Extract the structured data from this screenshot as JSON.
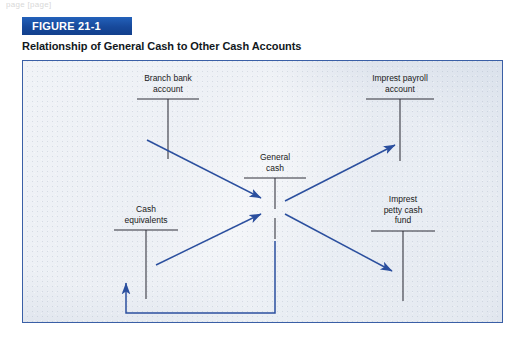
{
  "page": {
    "top_fragment": "page [page]"
  },
  "figure": {
    "banner_label": "FIGURE 21-1",
    "caption": "Relationship of General Cash to Other Cash Accounts",
    "banner_color": "#17499b",
    "frame_border_color": "#3a5fa6",
    "panel_background": "#d8dfe9",
    "arrow_color": "#2b4f9e",
    "taccount_color": "#2f2f38"
  },
  "diagram": {
    "type": "flow",
    "accounts": [
      {
        "id": "branch-bank-account",
        "lines": [
          "Branch bank",
          "account"
        ],
        "label_x": 145,
        "label_y": 16,
        "t_center_x": 145,
        "t_top_y": 38,
        "t_half_width": 31,
        "t_stem_bottom_y": 98
      },
      {
        "id": "imprest-payroll-account",
        "lines": [
          "Imprest payroll",
          "account"
        ],
        "label_x": 377,
        "label_y": 16,
        "t_center_x": 377,
        "t_top_y": 38,
        "t_half_width": 34,
        "t_stem_bottom_y": 100
      },
      {
        "id": "general-cash",
        "lines": [
          "General",
          "cash"
        ],
        "label_x": 252,
        "label_y": 95,
        "t_center_x": 252,
        "t_top_y": 117,
        "t_half_width": 31,
        "t_stem_bottom_y": 178
      },
      {
        "id": "cash-equivalents",
        "lines": [
          "Cash",
          "equivalents"
        ],
        "label_x": 123,
        "label_y": 147,
        "t_center_x": 123,
        "t_top_y": 169,
        "t_half_width": 32,
        "t_stem_bottom_y": 238
      },
      {
        "id": "imprest-petty-cash-fund",
        "lines": [
          "Imprest",
          "petty cash",
          "fund"
        ],
        "label_x": 380,
        "label_y": 137,
        "t_center_x": 380,
        "t_top_y": 170,
        "t_half_width": 32,
        "t_stem_bottom_y": 240
      }
    ],
    "flows": [
      {
        "id": "branch-bank-to-general-cash",
        "from": "branch-bank-account",
        "to": "general-cash",
        "direction": "into-general-cash"
      },
      {
        "id": "cash-equivalents-to-general-cash",
        "from": "cash-equivalents",
        "to": "general-cash",
        "direction": "into-general-cash"
      },
      {
        "id": "general-cash-to-imprest-payroll",
        "from": "general-cash",
        "to": "imprest-payroll-account",
        "direction": "out-of-general-cash"
      },
      {
        "id": "general-cash-to-imprest-petty-cash",
        "from": "general-cash",
        "to": "imprest-petty-cash-fund",
        "direction": "out-of-general-cash"
      },
      {
        "id": "general-cash-return-to-cash-equivalents",
        "from": "general-cash",
        "to": "cash-equivalents",
        "direction": "return-path"
      }
    ]
  }
}
